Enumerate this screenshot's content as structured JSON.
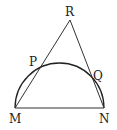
{
  "diagram": {
    "labels": {
      "R": "R",
      "P": "P",
      "Q": "Q",
      "M": "M",
      "N": "N"
    },
    "points": {
      "M": [
        15,
        108
      ],
      "N": [
        104,
        108
      ],
      "R": [
        70,
        20
      ],
      "P": [
        39,
        67
      ],
      "Q": [
        92,
        75
      ]
    },
    "shapes": [
      {
        "type": "segment",
        "from": "M",
        "to": "N"
      },
      {
        "type": "segment",
        "from": "M",
        "to": "R"
      },
      {
        "type": "segment",
        "from": "R",
        "to": "N"
      },
      {
        "type": "semicircle",
        "diameter": [
          "M",
          "N"
        ],
        "passes_through": [
          "P",
          "Q"
        ]
      }
    ]
  }
}
